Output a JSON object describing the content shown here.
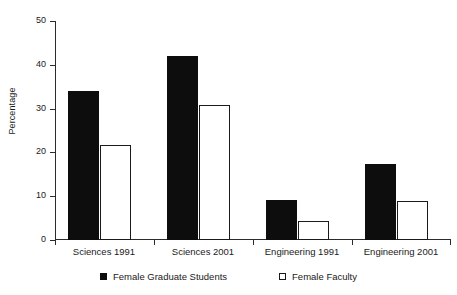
{
  "chart_data": {
    "type": "bar",
    "title": "",
    "subtitle": "",
    "xlabel": "",
    "ylabel": "Percentage",
    "categories": [
      "Sciences 1991",
      "Sciences 2001",
      "Engineering 1991",
      "Engineering 2001"
    ],
    "series": [
      {
        "name": "Female Graduate Students",
        "marker": "filled-square",
        "color": "#0d0d0d",
        "values": [
          34.0,
          42.0,
          9.2,
          17.4
        ]
      },
      {
        "name": "Female Faculty",
        "marker": "open-square",
        "color": "#ffffff",
        "values": [
          21.8,
          30.9,
          4.3,
          8.8
        ]
      }
    ],
    "ylim": [
      0,
      50
    ],
    "yticks": [
      0,
      10,
      20,
      30,
      40,
      50
    ],
    "ytick_labels": [
      "0",
      "10",
      "20",
      "30",
      "40",
      "50"
    ],
    "grid": false,
    "legend_position": "bottom",
    "background_color": "#ffffff",
    "axis_color": "#2b2b2b"
  },
  "axis": {
    "y_title": "Percentage",
    "tick_labels": [
      "50",
      "40",
      "30",
      "20",
      "10",
      "0"
    ]
  },
  "categories": [
    {
      "label": "Sciences 1991"
    },
    {
      "label": "Sciences 2001"
    },
    {
      "label": "Engineering 1991"
    },
    {
      "label": "Engineering 2001"
    }
  ],
  "legend": {
    "items": [
      {
        "label": "Female Graduate Students",
        "marker": "filled-square"
      },
      {
        "label": "Female Faculty",
        "marker": "open-square"
      }
    ]
  }
}
